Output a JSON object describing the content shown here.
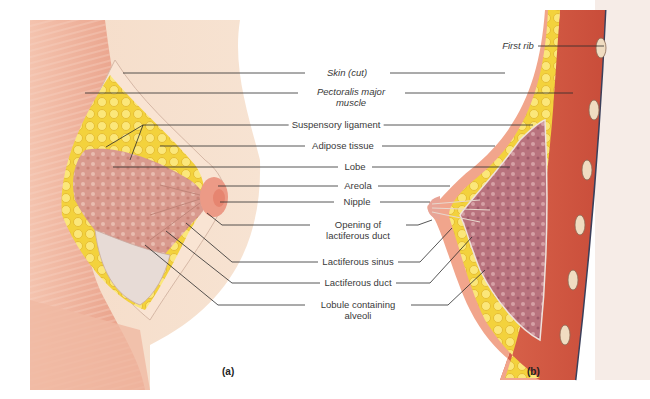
{
  "figure": {
    "panel_labels": [
      "(a)",
      "(b)"
    ],
    "labels": [
      {
        "id": "skin-cut",
        "text": "Skin (cut)",
        "italic": true,
        "x": 337,
        "y": 68
      },
      {
        "id": "pectoralis-major",
        "text": "Pectoralis major muscle",
        "italic": true,
        "x": 337,
        "y": 88
      },
      {
        "id": "first-rib",
        "text": "First rib",
        "italic": true,
        "x": 521,
        "y": 42
      },
      {
        "id": "suspensory-ligament",
        "text": "Suspensory ligament",
        "italic": false,
        "x": 333,
        "y": 121
      },
      {
        "id": "adipose-tissue",
        "text": "Adipose tissue",
        "italic": false,
        "x": 341,
        "y": 142
      },
      {
        "id": "lobe",
        "text": "Lobe",
        "italic": false,
        "x": 354,
        "y": 163
      },
      {
        "id": "areola",
        "text": "Areola",
        "italic": false,
        "x": 357,
        "y": 184
      },
      {
        "id": "nipple",
        "text": "Nipple",
        "italic": false,
        "x": 356,
        "y": 203
      },
      {
        "id": "opening-lactiferous-duct",
        "text": "Opening of lactiferous duct",
        "italic": false,
        "x": 357,
        "y": 221
      },
      {
        "id": "lactiferous-sinus",
        "text": "Lactiferous sinus",
        "italic": false,
        "x": 357,
        "y": 260
      },
      {
        "id": "lactiferous-duct",
        "text": "Lactiferous duct",
        "italic": false,
        "x": 357,
        "y": 280
      },
      {
        "id": "lobule-containing-alveoli",
        "text": "Lobule containing alveoli",
        "italic": false,
        "x": 357,
        "y": 298
      }
    ]
  }
}
